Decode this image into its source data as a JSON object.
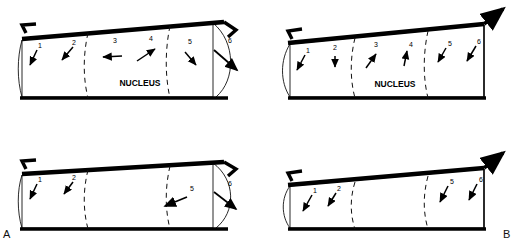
{
  "figure": {
    "type": "scientific-diagram",
    "background_color": "#ffffff",
    "ink_color": "#000000",
    "panel_labels": [
      {
        "id": "A",
        "text": "A",
        "position": "bottom-left"
      },
      {
        "id": "B",
        "text": "B",
        "position": "bottom-right"
      }
    ]
  },
  "panels": [
    {
      "id": "A-top",
      "row": "top",
      "column": "left",
      "nucleus_label": "NUCLEUS",
      "has_nucleus_label": true,
      "left_cap": "concave",
      "right_cap": "convex",
      "left_arrow": "hook-left",
      "right_arrow": "hook-right",
      "divider_count": 2,
      "markers": [
        {
          "label": "1",
          "direction": "down-left"
        },
        {
          "label": "2",
          "direction": "down-left"
        },
        {
          "label": "3",
          "direction": "left"
        },
        {
          "label": "4",
          "direction": "up-right"
        },
        {
          "label": "5",
          "direction": "down-right"
        },
        {
          "label": "6",
          "direction": "down-right-long"
        }
      ]
    },
    {
      "id": "B-top",
      "row": "top",
      "column": "right",
      "nucleus_label": "NUCLEUS",
      "has_nucleus_label": true,
      "left_cap": "convex",
      "right_cap": "straight",
      "left_arrow": "hook-left",
      "right_arrow": "diagonal-up-right",
      "divider_count": 2,
      "markers": [
        {
          "label": "1",
          "direction": "down-left"
        },
        {
          "label": "2",
          "direction": "down"
        },
        {
          "label": "3",
          "direction": "up-right"
        },
        {
          "label": "4",
          "direction": "up"
        },
        {
          "label": "5",
          "direction": "down-left"
        },
        {
          "label": "6",
          "direction": "down-left"
        }
      ]
    },
    {
      "id": "A-bottom",
      "row": "bottom",
      "column": "left",
      "nucleus_label": "",
      "has_nucleus_label": false,
      "left_cap": "concave",
      "right_cap": "convex",
      "left_arrow": "hook-left",
      "right_arrow": "hook-right",
      "divider_count": 2,
      "markers": [
        {
          "label": "1",
          "direction": "down-left"
        },
        {
          "label": "2",
          "direction": "down-left"
        },
        {
          "label": "5",
          "direction": "down-left-long"
        },
        {
          "label": "6",
          "direction": "down-right-long"
        }
      ]
    },
    {
      "id": "B-bottom",
      "row": "bottom",
      "column": "right",
      "nucleus_label": "",
      "has_nucleus_label": false,
      "left_cap": "convex",
      "right_cap": "straight",
      "left_arrow": "hook-left",
      "right_arrow": "diagonal-up-right",
      "divider_count": 2,
      "markers": [
        {
          "label": "1",
          "direction": "down-left"
        },
        {
          "label": "2",
          "direction": "down-left"
        },
        {
          "label": "5",
          "direction": "down-left"
        },
        {
          "label": "6",
          "direction": "down-left"
        }
      ]
    }
  ]
}
